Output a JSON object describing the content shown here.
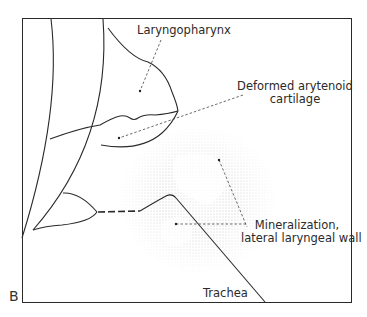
{
  "figure": {
    "panel_letter": "B",
    "labels": {
      "laryngopharynx": "Laryngopharynx",
      "arytenoid_line1": "Deformed arytenoid",
      "arytenoid_line2": "cartilage",
      "mineralization_line1": "Mineralization,",
      "mineralization_line2": "lateral laryngeal wall",
      "trachea": "Trachea"
    },
    "colors": {
      "line": "#2a2a2a",
      "stipple": "#8a8a8a",
      "background": "#ffffff"
    }
  }
}
